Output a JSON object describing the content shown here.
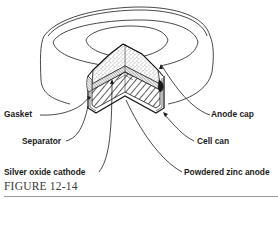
{
  "figure": {
    "caption": "FIGURE 12-14"
  },
  "labels": {
    "gasket": "Gasket",
    "separator": "Separator",
    "silver_oxide_cathode": "Silver oxide cathode",
    "anode_cap": "Anode cap",
    "cell_can": "Cell can",
    "powdered_zinc_anode": "Powdered zinc anode"
  },
  "colors": {
    "line": "#1a1a1a",
    "caption": "#3a3a3a",
    "rule": "#9a9a9a",
    "background": "#ffffff"
  }
}
